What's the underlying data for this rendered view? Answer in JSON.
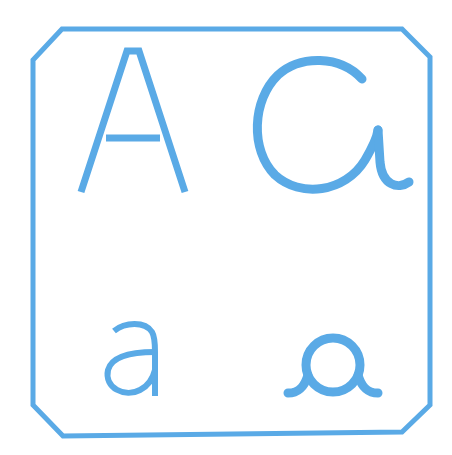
{
  "card": {
    "letters": {
      "upper_print": "A",
      "upper_cursive": "a",
      "lower_print": "a",
      "lower_cursive": "a"
    },
    "colors": {
      "stroke": "#5aaae6",
      "background": "#ffffff"
    }
  }
}
